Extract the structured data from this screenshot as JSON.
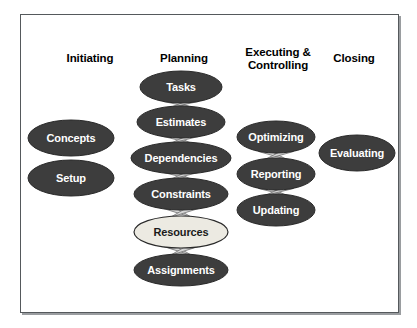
{
  "diagram": {
    "type": "process-flow",
    "background_color": "#ffffff",
    "frame": {
      "border_color": "#55595c",
      "shadow_color": "#9a9da0",
      "fill_color": "#ffffff"
    },
    "palette": {
      "node_dark_fill": "#3d3d3d",
      "node_dark_stroke": "#2a2a2a",
      "node_dark_text": "#ffffff",
      "node_light_fill": "#eceae2",
      "node_light_stroke": "#2a2a2a",
      "node_light_text": "#1a1a1a",
      "connector_fill": "#d6d6d6",
      "connector_stroke": "#6e6e6e",
      "header_text": "#000000"
    },
    "columns": [
      {
        "id": "initiating",
        "label": "Initiating",
        "cx": 90,
        "label_y": 52,
        "label_lines": 1
      },
      {
        "id": "planning",
        "label": "Planning",
        "cx": 184,
        "label_y": 52,
        "label_lines": 1
      },
      {
        "id": "executing",
        "label": "Executing &\nControlling",
        "cx": 278,
        "label_y": 46,
        "label_lines": 2
      },
      {
        "id": "closing",
        "label": "Closing",
        "cx": 354,
        "label_y": 52,
        "label_lines": 1
      }
    ],
    "nodes": [
      {
        "id": "concepts",
        "label": "Concepts",
        "column": "initiating",
        "cx": 71,
        "cy": 138,
        "rx": 43,
        "ry": 18,
        "style": "dark"
      },
      {
        "id": "setup",
        "label": "Setup",
        "column": "initiating",
        "cx": 71,
        "cy": 178,
        "rx": 43,
        "ry": 18,
        "style": "dark"
      },
      {
        "id": "tasks",
        "label": "Tasks",
        "column": "planning",
        "cx": 181,
        "cy": 87,
        "rx": 41,
        "ry": 16,
        "style": "dark"
      },
      {
        "id": "estimates",
        "label": "Estimates",
        "column": "planning",
        "cx": 181,
        "cy": 122,
        "rx": 44,
        "ry": 16,
        "style": "dark"
      },
      {
        "id": "dependencies",
        "label": "Dependencies",
        "column": "planning",
        "cx": 181,
        "cy": 158,
        "rx": 50,
        "ry": 16,
        "style": "dark"
      },
      {
        "id": "constraints",
        "label": "Constraints",
        "column": "planning",
        "cx": 181,
        "cy": 194,
        "rx": 47,
        "ry": 16,
        "style": "dark"
      },
      {
        "id": "resources",
        "label": "Resources",
        "column": "planning",
        "cx": 181,
        "cy": 232,
        "rx": 47,
        "ry": 16,
        "style": "light"
      },
      {
        "id": "assignments",
        "label": "Assignments",
        "column": "planning",
        "cx": 181,
        "cy": 270,
        "rx": 47,
        "ry": 16,
        "style": "dark"
      },
      {
        "id": "optimizing",
        "label": "Optimizing",
        "column": "executing",
        "cx": 276,
        "cy": 137,
        "rx": 39,
        "ry": 16,
        "style": "dark"
      },
      {
        "id": "reporting",
        "label": "Reporting",
        "column": "executing",
        "cx": 276,
        "cy": 174,
        "rx": 39,
        "ry": 16,
        "style": "dark"
      },
      {
        "id": "updating",
        "label": "Updating",
        "column": "executing",
        "cx": 276,
        "cy": 210,
        "rx": 39,
        "ry": 16,
        "style": "dark"
      },
      {
        "id": "evaluating",
        "label": "Evaluating",
        "column": "closing",
        "cx": 357,
        "cy": 153,
        "rx": 38,
        "ry": 18,
        "style": "dark"
      }
    ],
    "connectors": [
      {
        "from": "tasks",
        "to": "estimates"
      },
      {
        "from": "estimates",
        "to": "dependencies"
      },
      {
        "from": "dependencies",
        "to": "constraints"
      },
      {
        "from": "constraints",
        "to": "resources"
      },
      {
        "from": "resources",
        "to": "assignments"
      },
      {
        "from": "optimizing",
        "to": "reporting"
      },
      {
        "from": "reporting",
        "to": "updating"
      }
    ]
  }
}
